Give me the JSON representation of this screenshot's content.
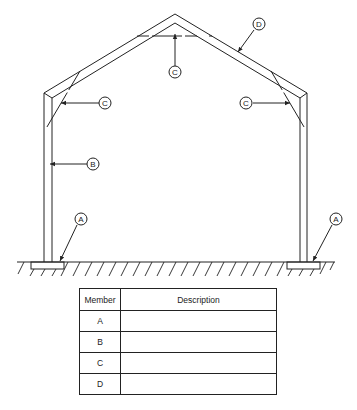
{
  "diagram": {
    "callouts": [
      {
        "id": "A",
        "label": "A",
        "target": "left footing"
      },
      {
        "id": "A",
        "label": "A",
        "target": "right footing"
      },
      {
        "id": "B",
        "label": "B",
        "target": "left column"
      },
      {
        "id": "C",
        "label": "C",
        "target": "left knee brace"
      },
      {
        "id": "C",
        "label": "C",
        "target": "ridge collar tie"
      },
      {
        "id": "C",
        "label": "C",
        "target": "right knee brace"
      },
      {
        "id": "D",
        "label": "D",
        "target": "rafter"
      }
    ],
    "colors": {
      "line": "#222222",
      "background": "#ffffff"
    }
  },
  "table": {
    "headers": {
      "member": "Member",
      "description": "Description"
    },
    "rows": [
      {
        "member": "A",
        "description": ""
      },
      {
        "member": "B",
        "description": ""
      },
      {
        "member": "C",
        "description": ""
      },
      {
        "member": "D",
        "description": ""
      }
    ]
  }
}
